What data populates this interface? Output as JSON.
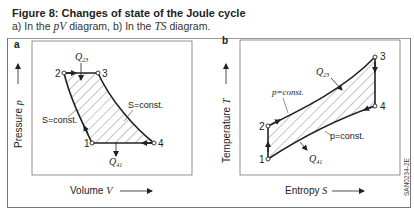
{
  "figure": {
    "title": "Figure 8: Changes of state of the Joule cycle",
    "subtitle_a": "a) In the ",
    "subtitle_pv": "pV",
    "subtitle_mid": " diagram, b) In the ",
    "subtitle_ts": "TS",
    "subtitle_end": " diagram.",
    "code": "SAN0234-2E"
  },
  "panel_a": {
    "label": "a",
    "x_axis": "Volume",
    "x_symbol": "V",
    "y_axis": "Pressure",
    "y_symbol": "p",
    "points": {
      "1": "1",
      "2": "2",
      "3": "3",
      "4": "4"
    },
    "heat_in": "Q",
    "heat_in_sub": "23",
    "heat_out": "Q",
    "heat_out_sub": "41",
    "isentrope_left": "S=const.",
    "isentrope_right": "S=const."
  },
  "panel_b": {
    "label": "b",
    "x_axis": "Entropy",
    "x_symbol": "S",
    "y_axis": "Temperature",
    "y_symbol": "T",
    "points": {
      "1": "1",
      "2": "2",
      "3": "3",
      "4": "4"
    },
    "heat_in": "Q",
    "heat_in_sub": "23",
    "heat_out": "Q",
    "heat_out_sub": "41",
    "isobar_upper": "p=const.",
    "isobar_lower": "p=const."
  },
  "colors": {
    "line": "#222222",
    "hatch": "#555555",
    "frame": "#777777"
  }
}
